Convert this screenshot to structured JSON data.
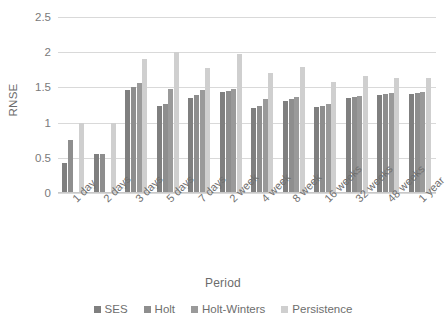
{
  "chart_data": {
    "type": "bar",
    "title": "",
    "xlabel": "Period",
    "ylabel": "RNSE",
    "ylim": [
      0,
      2.5
    ],
    "ytick_step": 0.5,
    "yticks": [
      "0",
      "0.5",
      "1",
      "1.5",
      "2",
      "2.5"
    ],
    "grid": true,
    "legend_position": "bottom",
    "categories": [
      "1 day",
      "2 days",
      "3 days",
      "5 days",
      "7 days",
      "2 week",
      "4 week",
      "8 week",
      "16 weeks",
      "32 weeks",
      "48 weeks",
      "1 year"
    ],
    "series": [
      {
        "name": "SES",
        "color": "#7f7f7f",
        "values": [
          0.42,
          0.55,
          1.47,
          1.23,
          1.35,
          1.43,
          1.21,
          1.31,
          1.22,
          1.35,
          1.39,
          1.4
        ]
      },
      {
        "name": "Holt",
        "color": "#8e8e8e",
        "values": [
          0.75,
          0.56,
          1.5,
          1.26,
          1.39,
          1.45,
          1.23,
          1.33,
          1.24,
          1.37,
          1.41,
          1.42
        ]
      },
      {
        "name": "Holt-Winters",
        "color": "#9a9a9a",
        "values": [
          null,
          null,
          1.56,
          1.48,
          1.46,
          1.48,
          1.33,
          1.36,
          1.27,
          1.38,
          1.42,
          1.43
        ]
      },
      {
        "name": "Persistence",
        "color": "#cfcfcf",
        "values": [
          0.99,
          0.99,
          1.9,
          2.0,
          1.78,
          1.97,
          1.7,
          1.79,
          1.58,
          1.66,
          1.63,
          1.64
        ]
      }
    ]
  },
  "axis": {
    "y_title": "RNSE",
    "x_title": "Period"
  },
  "style": {
    "gridline_color": "#d9d9d9",
    "axis_color": "#c8c8c8",
    "text_color": "#6e6e6e",
    "background": "#ffffff"
  }
}
